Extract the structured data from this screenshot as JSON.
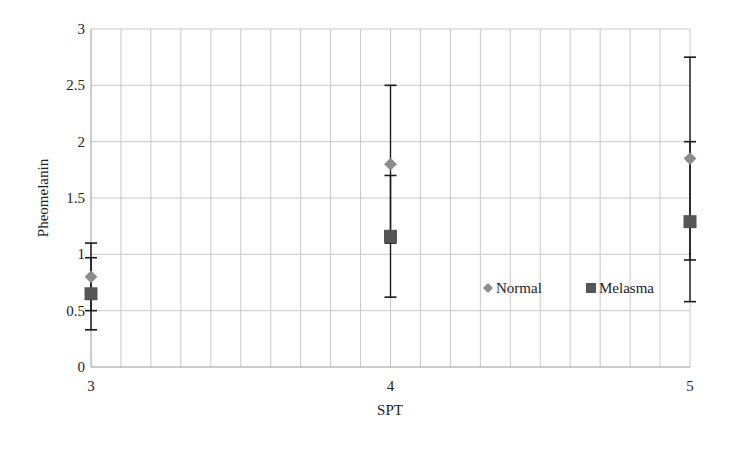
{
  "chart_data": {
    "type": "scatter",
    "title": "",
    "xlabel": "SPT",
    "ylabel": "Pheomelanin",
    "xlim": [
      3,
      5
    ],
    "ylim": [
      0,
      3
    ],
    "x_ticks": [
      "3",
      "4",
      "5"
    ],
    "y_ticks": [
      "0",
      "0.5",
      "1",
      "1.5",
      "2",
      "2.5",
      "3"
    ],
    "grid": true,
    "legend_position": "inside-right",
    "x": [
      3,
      4,
      5
    ],
    "series": [
      {
        "name": "Normal",
        "marker": "diamond",
        "color": "#8c8c8c",
        "values": [
          0.8,
          1.8,
          1.85
        ],
        "error": [
          0.3,
          0.7,
          0.9
        ],
        "upper": [
          1.1,
          2.5,
          2.75
        ],
        "lower": [
          0.5,
          1.1,
          0.95
        ]
      },
      {
        "name": "Melasma",
        "marker": "square",
        "color": "#555555",
        "values": [
          0.65,
          1.16,
          1.29
        ],
        "error": [
          0.32,
          0.54,
          0.71
        ],
        "upper": [
          0.97,
          1.7,
          2.0
        ],
        "lower": [
          0.33,
          0.62,
          0.58
        ]
      }
    ]
  },
  "legend": {
    "items": [
      {
        "label": "Normal",
        "marker": "diamond",
        "color": "#8c8c8c"
      },
      {
        "label": "Melasma",
        "marker": "square",
        "color": "#555555"
      }
    ]
  },
  "colors": {
    "grid": "#c8c8c8",
    "axis": "#9a9a9a",
    "error_bar": "#1a1a1a"
  }
}
